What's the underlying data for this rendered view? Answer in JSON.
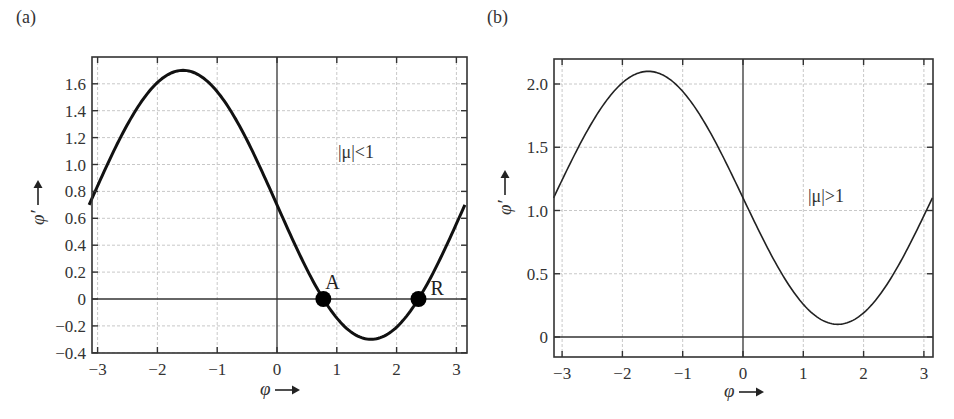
{
  "chart_data": [
    {
      "panel": "(a)",
      "type": "line",
      "title": "",
      "xlabel": "φ →",
      "ylabel": "φ′ →",
      "xlim": [
        -3.14159,
        3.14159
      ],
      "ylim": [
        -0.4,
        1.75
      ],
      "xticks": [
        -3,
        -2,
        -1,
        0,
        1,
        2,
        3
      ],
      "xtick_labels": [
        "−3",
        "−2",
        "−1",
        "0",
        "1",
        "2",
        "3"
      ],
      "yticks": [
        -0.4,
        -0.2,
        0,
        0.2,
        0.4,
        0.6,
        0.8,
        1.0,
        1.2,
        1.4,
        1.6
      ],
      "ytick_labels": [
        "−0.4",
        "−0.2",
        "0",
        "0.2",
        "0.4",
        "0.6",
        "0.8",
        "1.0",
        "1.2",
        "1.4",
        "1.6"
      ],
      "grid": true,
      "series": [
        {
          "name": "φ′ = 0.7 − sin φ",
          "offset": 0.7,
          "x": [
            -3.14,
            -2.5,
            -2.0,
            -1.57,
            -1.0,
            -0.5,
            0,
            0.5,
            0.775,
            1.0,
            1.57,
            2.0,
            2.366,
            2.5,
            3.14
          ],
          "y": [
            0.7,
            1.3,
            1.61,
            1.7,
            1.54,
            1.18,
            0.7,
            0.22,
            0.0,
            -0.14,
            -0.3,
            -0.21,
            0.0,
            0.1,
            0.7
          ]
        }
      ],
      "annotations": [
        {
          "text": "|μ|<1",
          "x": 0.95,
          "y": 1.1
        },
        {
          "text": "A",
          "x": 0.775,
          "y": 0,
          "marker": "filled-circle"
        },
        {
          "text": "R",
          "x": 2.366,
          "y": 0,
          "marker": "filled-circle"
        }
      ]
    },
    {
      "panel": "(b)",
      "type": "line",
      "title": "",
      "xlabel": "φ →",
      "ylabel": "φ′ →",
      "xlim": [
        -3.14159,
        3.14159
      ],
      "ylim": [
        -0.15,
        2.2
      ],
      "xticks": [
        -3,
        -2,
        -1,
        0,
        1,
        2,
        3
      ],
      "xtick_labels": [
        "−3",
        "−2",
        "−1",
        "0",
        "1",
        "2",
        "3"
      ],
      "yticks": [
        0,
        0.5,
        1.0,
        1.5,
        2.0
      ],
      "ytick_labels": [
        "0",
        "0.5",
        "1.0",
        "1.5",
        "2.0"
      ],
      "grid": true,
      "series": [
        {
          "name": "φ′ = 1.1 − sin φ",
          "offset": 1.1,
          "x": [
            -3.14,
            -2.5,
            -2.0,
            -1.57,
            -1.0,
            -0.5,
            0,
            0.5,
            1.0,
            1.57,
            2.0,
            2.5,
            3.14
          ],
          "y": [
            1.1,
            1.7,
            2.01,
            2.1,
            1.94,
            1.58,
            1.1,
            0.62,
            0.26,
            0.1,
            0.19,
            0.5,
            1.1
          ]
        }
      ],
      "annotations": [
        {
          "text": "|μ|>1",
          "x": 1.1,
          "y": 1.1
        }
      ]
    }
  ],
  "panels": {
    "a": {
      "label": "(a)",
      "annotation": "|μ|<1",
      "point_a": "A",
      "point_r": "R",
      "xlabel": "φ",
      "ylabel": "φ′"
    },
    "b": {
      "label": "(b)",
      "annotation": "|μ|>1",
      "xlabel": "φ",
      "ylabel": "φ′"
    }
  },
  "colors": {
    "curve": "#111111",
    "grid": "#c8c8c8",
    "frame": "#333333",
    "marker": "#000000"
  }
}
